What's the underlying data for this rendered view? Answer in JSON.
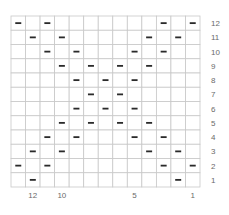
{
  "chart_data": {
    "type": "heatmap",
    "columns": 13,
    "rows": 12,
    "symbol": "purl-dash",
    "row_labels": [
      "12",
      "11",
      "10",
      "9",
      "8",
      "7",
      "6",
      "5",
      "4",
      "3",
      "2",
      "1"
    ],
    "column_labels": [
      {
        "col_from_left": 2,
        "label": "12"
      },
      {
        "col_from_left": 4,
        "label": "10"
      },
      {
        "col_from_left": 9,
        "label": "5"
      },
      {
        "col_from_left": 13,
        "label": "1"
      }
    ],
    "marks": [
      {
        "row": "12",
        "cols_from_left": [
          1,
          3,
          11,
          13
        ]
      },
      {
        "row": "11",
        "cols_from_left": [
          2,
          4,
          10,
          12
        ]
      },
      {
        "row": "10",
        "cols_from_left": [
          3,
          5,
          9,
          11
        ]
      },
      {
        "row": "9",
        "cols_from_left": [
          4,
          6,
          8,
          10
        ]
      },
      {
        "row": "8",
        "cols_from_left": [
          5,
          7,
          9
        ]
      },
      {
        "row": "7",
        "cols_from_left": [
          6,
          8
        ]
      },
      {
        "row": "6",
        "cols_from_left": [
          5,
          7,
          9
        ]
      },
      {
        "row": "5",
        "cols_from_left": [
          4,
          6,
          8,
          10
        ]
      },
      {
        "row": "4",
        "cols_from_left": [
          3,
          5,
          9,
          11
        ]
      },
      {
        "row": "3",
        "cols_from_left": [
          2,
          4,
          10,
          12
        ]
      },
      {
        "row": "2",
        "cols_from_left": [
          1,
          3,
          11,
          13
        ]
      },
      {
        "row": "1",
        "cols_from_left": [
          2,
          12
        ]
      }
    ],
    "colors": {
      "grid": "#c8c8c8",
      "mark": "#2a2a2a",
      "label": "#6a6a6a"
    }
  }
}
